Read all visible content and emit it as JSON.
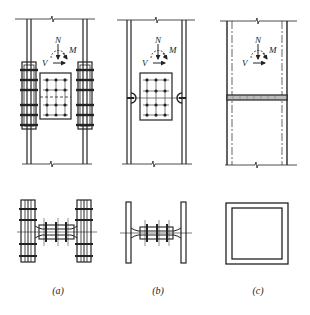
{
  "figure": {
    "panels": [
      {
        "id": "a",
        "label": "(a)",
        "description": "Bolted splice with flange splice plates and web splice plate",
        "load_symbols": {
          "axial": "N",
          "moment": "M",
          "shear": "V"
        }
      },
      {
        "id": "b",
        "label": "(b)",
        "description": "Welded flanges with bolted web splice plate",
        "load_symbols": {
          "axial": "N",
          "moment": "M",
          "shear": "V"
        }
      },
      {
        "id": "c",
        "label": "(c)",
        "description": "Box section column with full butt weld",
        "load_symbols": {
          "axial": "N",
          "moment": "M",
          "shear": "V"
        }
      }
    ],
    "colors": {
      "line": "#222222",
      "background": "#ffffff"
    }
  }
}
